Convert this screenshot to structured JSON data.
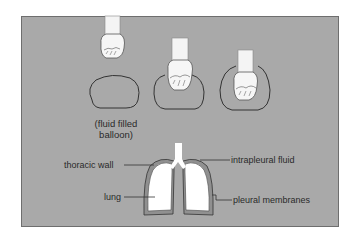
{
  "diagram": {
    "panel_color": "#a9a9a9",
    "balloon_caption": {
      "line1": "(fluid filled",
      "line2": "balloon)"
    },
    "stages": [
      {
        "id": "hand-above-balloon",
        "description": "fist above balloon"
      },
      {
        "id": "hand-pressing-balloon",
        "description": "fist pressing into balloon"
      },
      {
        "id": "hand-enclosed-by-balloon",
        "description": "fist enclosed by balloon"
      }
    ],
    "lung_labels": {
      "thoracic_wall": "thoracic wall",
      "lung": "lung",
      "intrapleural_fluid": "intrapleural fluid",
      "pleural_membranes": "pleural membranes"
    }
  }
}
